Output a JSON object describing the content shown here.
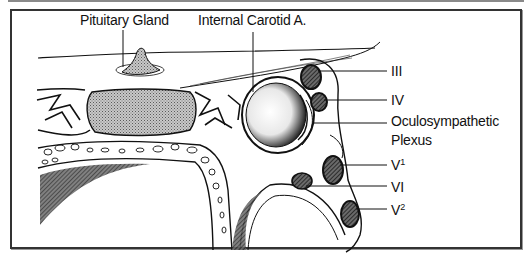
{
  "figure": {
    "labels": {
      "pituitary": "Pituitary Gland",
      "carotid": "Internal Carotid A.",
      "cn3": "III",
      "cn4": "IV",
      "oculo_line1": "Oculosympathetic",
      "oculo_line2": "Plexus",
      "v1_base": "V",
      "v1_sup": "1",
      "cn6": "VI",
      "v2_base": "V",
      "v2_sup": "2"
    },
    "colors": {
      "ink": "#111111",
      "frame": "#333333",
      "stipple": "#9a9a9a",
      "background": "#ffffff"
    }
  }
}
